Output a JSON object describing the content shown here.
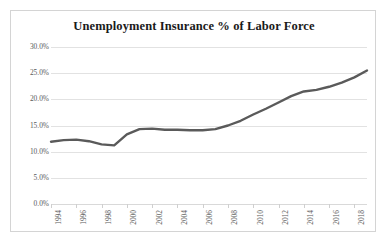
{
  "chart_data": {
    "type": "line",
    "title": "Unemployment Insurance % of Labor Force",
    "xlabel": "",
    "ylabel": "",
    "grid": true,
    "legend": false,
    "line_color": "#5a5a5a",
    "xlim": [
      1994,
      2019
    ],
    "ylim": [
      0,
      30
    ],
    "ytick_labels": [
      "30.0%",
      "25.0%",
      "20.0%",
      "15.0%",
      "10.0%",
      "5.0%",
      "0.0%"
    ],
    "ytick_values": [
      30,
      25,
      20,
      15,
      10,
      5,
      0
    ],
    "xtick_labels": [
      "1994",
      "1996",
      "1998",
      "2000",
      "2002",
      "2004",
      "2006",
      "2008",
      "2010",
      "2012",
      "2014",
      "2016",
      "2018"
    ],
    "xtick_values": [
      1994,
      1996,
      1998,
      2000,
      2002,
      2004,
      2006,
      2008,
      2010,
      2012,
      2014,
      2016,
      2018
    ],
    "x": [
      1994,
      1995,
      1996,
      1997,
      1998,
      1999,
      2000,
      2001,
      2002,
      2003,
      2004,
      2005,
      2006,
      2007,
      2008,
      2009,
      2010,
      2011,
      2012,
      2013,
      2014,
      2015,
      2016,
      2017,
      2018,
      2019
    ],
    "series": [
      {
        "name": "Unemployment Insurance % of Labor Force",
        "values": [
          11.9,
          12.2,
          12.3,
          12.0,
          11.4,
          11.2,
          13.3,
          14.3,
          14.4,
          14.2,
          14.2,
          14.1,
          14.1,
          14.3,
          15.0,
          15.9,
          17.1,
          18.2,
          19.4,
          20.6,
          21.5,
          21.8,
          22.4,
          23.2,
          24.2,
          25.5
        ]
      }
    ]
  }
}
